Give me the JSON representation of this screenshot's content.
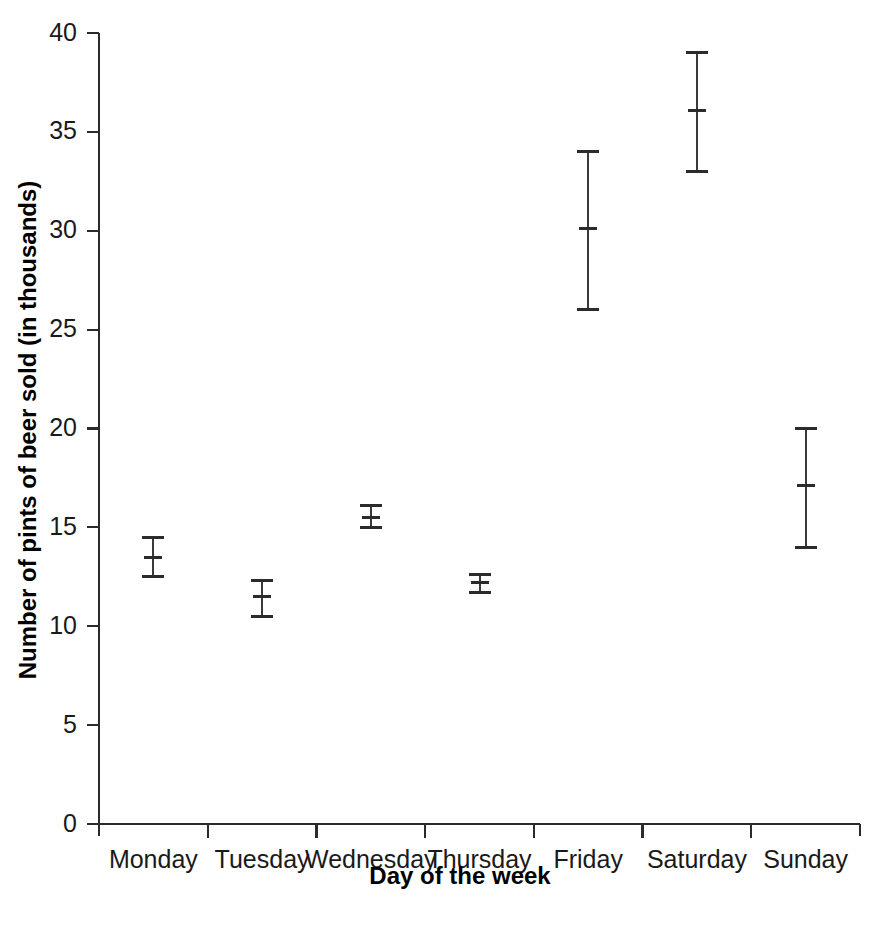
{
  "chart_data": {
    "type": "scatter",
    "title": "",
    "xlabel": "Day of the week",
    "ylabel": "Number of pints of beer sold (in thousands)",
    "categories": [
      "Monday",
      "Tuesday",
      "Wednesday",
      "Thursday",
      "Friday",
      "Saturday",
      "Sunday"
    ],
    "values": [
      13.5,
      11.5,
      15.5,
      12.2,
      30.1,
      36.1,
      17.1
    ],
    "error_low": [
      12.5,
      10.5,
      15.0,
      11.7,
      26.0,
      33.0,
      14.0
    ],
    "error_high": [
      14.5,
      12.3,
      16.1,
      12.6,
      34.0,
      39.0,
      20.0
    ],
    "series": [
      {
        "name": "Pints of beer sold",
        "points": [
          {
            "category": "Monday",
            "value": 13.5,
            "low": 12.5,
            "high": 14.5
          },
          {
            "category": "Tuesday",
            "value": 11.5,
            "low": 10.5,
            "high": 12.3
          },
          {
            "category": "Wednesday",
            "value": 15.5,
            "low": 15.0,
            "high": 16.1
          },
          {
            "category": "Thursday",
            "value": 12.2,
            "low": 11.7,
            "high": 12.6
          },
          {
            "category": "Friday",
            "value": 30.1,
            "low": 26.0,
            "high": 34.0
          },
          {
            "category": "Saturday",
            "value": 36.1,
            "low": 33.0,
            "high": 39.0
          },
          {
            "category": "Sunday",
            "value": 17.1,
            "low": 14.0,
            "high": 20.0
          }
        ]
      }
    ],
    "ylim": [
      0,
      40
    ],
    "yticks": [
      0,
      5,
      10,
      15,
      20,
      25,
      30,
      35,
      40
    ],
    "ytick_labels": [
      "0",
      "5",
      "10",
      "15",
      "20",
      "25",
      "30",
      "35",
      "40"
    ],
    "grid": false,
    "legend": null,
    "marker_style": "error-bar-with-center-tick",
    "colors": {
      "axis": "#2b2b2b",
      "marker": "#2b2b2b",
      "background": "#ffffff",
      "text": "#1a1a1a"
    }
  }
}
